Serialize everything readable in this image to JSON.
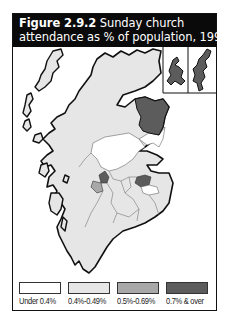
{
  "figure": {
    "number": "Figure 2.9.2",
    "title_line1_rest": "Sunday church",
    "title_line2": "attendance as % of population, 1994"
  },
  "colors": {
    "header_bg": "#0a0a0a",
    "under_0_4": "#ffffff",
    "c_0_4_0_49": "#e6e6e6",
    "c_0_5_0_69": "#a8a8a8",
    "c_0_7_over": "#5c5c5c",
    "outline": "#111111"
  },
  "legend": [
    {
      "label": "Under 0.4%",
      "color": "#ffffff"
    },
    {
      "label": "0.4%-0.49%",
      "color": "#e6e6e6"
    },
    {
      "label": "0.5%-0.69%",
      "color": "#a8a8a8"
    },
    {
      "label": "0.7% & over",
      "color": "#5c5c5c"
    }
  ],
  "map": {
    "insets": [
      "Orkney",
      "Shetland"
    ],
    "regions": [
      {
        "area": "Highland / north",
        "category": "0.4%-0.49%"
      },
      {
        "area": "North-east (Banff & Buchan / Gordon)",
        "category": "0.7% & over"
      },
      {
        "area": "Aberdeen / Kincardine",
        "category": "Under 0.4%"
      },
      {
        "area": "Central Perthshire / Tayside",
        "category": "Under 0.4%"
      },
      {
        "area": "Fife / Edinburgh area",
        "category": "0.7% & over"
      },
      {
        "area": "Glasgow area",
        "category": "0.7% & over"
      },
      {
        "area": "West of Glasgow",
        "category": "0.5%-0.69%"
      },
      {
        "area": "Southern Scotland",
        "category": "0.4%-0.49%"
      },
      {
        "area": "Orkney",
        "category": "0.7% & over"
      },
      {
        "area": "Shetland",
        "category": "0.7% & over"
      }
    ]
  }
}
